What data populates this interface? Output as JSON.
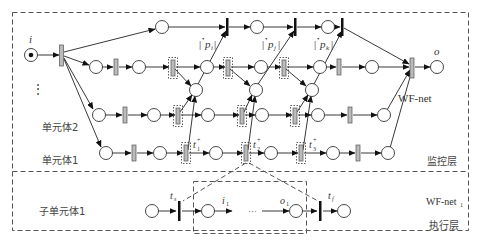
{
  "diagram": {
    "type": "petri-net-workflow",
    "layers": {
      "monitoring": {
        "label": "监控层",
        "net_label": "WF-net"
      },
      "execution": {
        "label": "执行层",
        "net_label": "WF-net",
        "net_label_sub": "1"
      }
    },
    "places": {
      "input": "i",
      "output": "o"
    },
    "units": {
      "unit2": "单元体2",
      "unit1": "单元体1",
      "ellipsis": "⋮",
      "subunit1": "子单元体1"
    },
    "pre_sets": [
      {
        "id": "pi",
        "label": "p",
        "sub": "i",
        "prefix": "•"
      },
      {
        "id": "pj",
        "label": "p",
        "sub": "j",
        "prefix": "•"
      },
      {
        "id": "pk",
        "label": "p",
        "sub": "k",
        "prefix": "•"
      }
    ],
    "transitions": [
      {
        "id": "t1",
        "label": "t",
        "sub": "1",
        "sup": "+"
      },
      {
        "id": "t2",
        "label": "t",
        "sub": "2",
        "sup": "+"
      },
      {
        "id": "t3",
        "label": "t",
        "sub": "3",
        "sup": "+"
      }
    ],
    "subnet": {
      "start_transition": {
        "label": "t",
        "sub": "s"
      },
      "input_place": {
        "label": "i",
        "sub": "1"
      },
      "ellipsis": "···",
      "output_place": {
        "label": "o",
        "sub": "1"
      },
      "final_transition": {
        "label": "t",
        "sub": "f"
      }
    }
  }
}
